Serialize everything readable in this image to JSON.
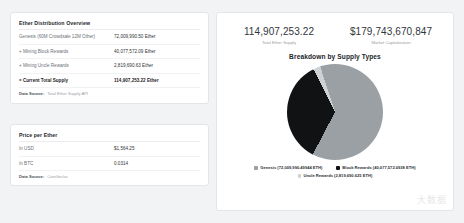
{
  "distribution": {
    "title": "Ether Distribution Overview",
    "rows": [
      {
        "label": "Genesis (60M Crowdsale 12M Other)",
        "value": "72,009,990.50 Ether",
        "total": false
      },
      {
        "label": "+ Mining Block Rewards",
        "value": "40,077,572.09 Ether",
        "total": false
      },
      {
        "label": "+ Mining Uncle Rewards",
        "value": "2,819,690.63 Ether",
        "total": false
      },
      {
        "label": "= Current Total Supply",
        "value": "114,907,253.22 Ether",
        "total": true
      }
    ],
    "source_key": "Data Source:",
    "source_value": "Total Ether Supply API"
  },
  "price": {
    "title": "Price per Ether",
    "rows": [
      {
        "label": "In USD",
        "value": "$1,564.25"
      },
      {
        "label": "In BTC",
        "value": "0.0314"
      }
    ],
    "source_key": "Data Source:",
    "source_value": "CoinGecko"
  },
  "stats": [
    {
      "value": "114,907,253.22",
      "label": "Total Ether Supply"
    },
    {
      "value": "$179,743,670,847",
      "label": "Market Capitalization"
    }
  ],
  "chart_data": {
    "type": "pie",
    "title": "Breakdown by Supply Types",
    "categories": [
      "Genesis",
      "Block Rewards",
      "Uncle Rewards"
    ],
    "values": [
      72009990.5,
      40077572.09,
      2819690.63
    ],
    "percent": [
      62.67,
      34.88,
      2.45
    ],
    "colors": [
      "#9aa0a4",
      "#101214",
      "#cfd2d5"
    ],
    "legend_position": "bottom",
    "legend": [
      {
        "label": "Genesis (72,009,990.49944 ETH)",
        "color": "#9aa0a4"
      },
      {
        "label": "Block Rewards (40,077,572.0938 ETH)",
        "color": "#101214"
      },
      {
        "label": "Uncle Rewards (2,819,690.625 ETH)",
        "color": "#cfd2d5"
      }
    ]
  },
  "watermark": "大数据"
}
